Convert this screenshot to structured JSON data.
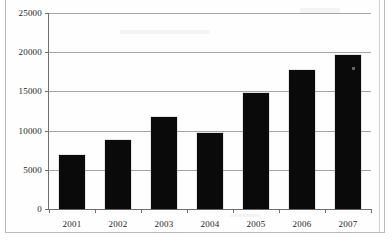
{
  "chart_data": {
    "type": "bar",
    "title": "",
    "subtitle": "",
    "xlabel": "",
    "ylabel": "",
    "categories": [
      "2001",
      "2002",
      "2003",
      "2004",
      "2005",
      "2006",
      "2007"
    ],
    "values": [
      6900,
      8800,
      11800,
      9750,
      14800,
      17700,
      19600
    ],
    "series": [
      {
        "name": "",
        "values": [
          6900,
          8800,
          11800,
          9750,
          14800,
          17700,
          19600
        ]
      }
    ],
    "ylim": [
      0,
      25000
    ],
    "yticks": [
      0,
      5000,
      10000,
      15000,
      20000,
      25000
    ],
    "ytick_labels": [
      "0",
      "5000",
      "10000",
      "15000",
      "20000",
      "25000"
    ],
    "xtick_labels": [
      "2001",
      "2002",
      "2003",
      "2004",
      "2005",
      "2006",
      "2007"
    ],
    "grid": true,
    "grid_axis": "y",
    "legend": false,
    "legend_position": "none",
    "bar_color": "#0a0a0a",
    "gridline_color": "#a6a6a6",
    "axis_color": "#6f6f6f",
    "background_color": "#ffffff"
  }
}
